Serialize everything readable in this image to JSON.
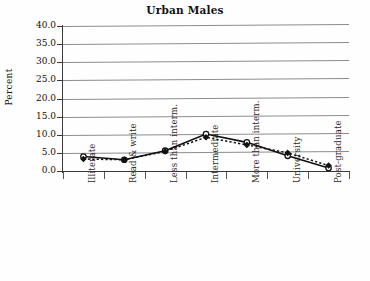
{
  "chart_data": {
    "type": "line",
    "title": "Urban Males",
    "xlabel": "",
    "ylabel": "Percent",
    "categories": [
      "Illiterate",
      "Read & write",
      "Less than interm.",
      "Intermediate",
      "More than interm.",
      "University",
      "Post-graduate"
    ],
    "series": [
      {
        "name": "series-open-solid",
        "marker": "open-circle",
        "line": "solid",
        "values": [
          4.0,
          3.1,
          5.6,
          10.2,
          7.9,
          4.2,
          0.8
        ]
      },
      {
        "name": "series-filled-dashed",
        "marker": "filled-diamond",
        "line": "dashed",
        "values": [
          3.3,
          3.1,
          5.4,
          9.3,
          7.2,
          5.0,
          1.5
        ]
      }
    ],
    "ylim": [
      0.0,
      40.0
    ],
    "ytick_step": 5.0,
    "ytick_labels": [
      "0.0",
      "5.0",
      "10.0",
      "15.0",
      "20.0",
      "25.0",
      "30.0",
      "35.0",
      "40.0"
    ],
    "grid": "horizontal",
    "legend": "none",
    "colors": {
      "line": "#111111",
      "grid": "#8c8c8c",
      "axis": "#3a3a3a",
      "background": "#fefefe"
    }
  }
}
